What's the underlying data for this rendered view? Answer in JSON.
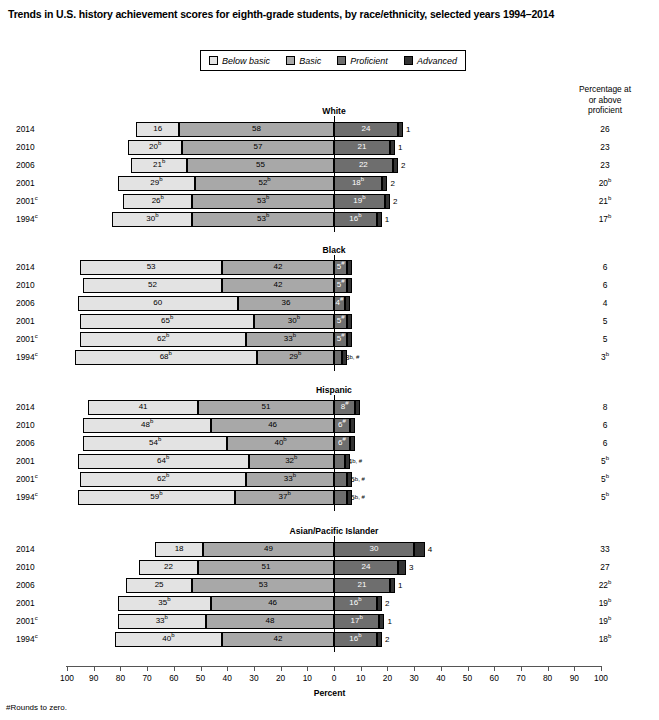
{
  "title": "Trends in U.S. history achievement scores for eighth-grade students, by race/ethnicity, selected years 1994–2014",
  "legend": {
    "items": [
      {
        "label": "Below basic",
        "color": "#e3e3e3",
        "key": "below"
      },
      {
        "label": "Basic",
        "color": "#a8a8a8",
        "key": "basic"
      },
      {
        "label": "Proficient",
        "color": "#6e6e6e",
        "key": "prof"
      },
      {
        "label": "Advanced",
        "color": "#333333",
        "key": "adv"
      }
    ]
  },
  "right_header": "Percentage at\nor above\nproficient",
  "right_header_lines": [
    "Percentage at",
    "or above",
    "proficient"
  ],
  "axis": {
    "label": "Percent",
    "ticks": [
      100,
      90,
      80,
      70,
      60,
      50,
      40,
      30,
      20,
      10,
      0,
      10,
      20,
      30,
      40,
      50,
      60,
      70,
      80,
      90,
      100
    ],
    "zero_index": 10,
    "left_max": 100,
    "right_max": 100
  },
  "footnote": "#Rounds to zero.",
  "chart_data": {
    "type": "bar",
    "title": "Trends in U.S. history achievement scores for eighth-grade students, by race/ethnicity, selected years 1994–2014",
    "subtype": "diverging-stacked-bar",
    "xlabel": "Percent",
    "ylabel": "",
    "xlim": [
      -100,
      100
    ],
    "grid": false,
    "legend_position": "top-center",
    "categories": [
      "Below basic",
      "Basic",
      "Proficient",
      "Advanced"
    ],
    "note": "Bars are centered so that the boundary between Basic and Proficient sits at the 0 axis position; percentages left of zero are Below basic + Basic, right of zero are Proficient + Advanced.",
    "groups": [
      {
        "name": "White",
        "rows": [
          {
            "year": "2014",
            "year_sup": "",
            "below": 16,
            "below_sup": "",
            "basic": 58,
            "basic_sup": "",
            "prof": 24,
            "prof_sup": "",
            "adv": 1,
            "adv_sup": "",
            "at_or_above": "26",
            "at_or_above_sup": ""
          },
          {
            "year": "2010",
            "year_sup": "",
            "below": 20,
            "below_sup": "b",
            "basic": 57,
            "basic_sup": "",
            "prof": 21,
            "prof_sup": "",
            "adv": 1,
            "adv_sup": "",
            "at_or_above": "23",
            "at_or_above_sup": ""
          },
          {
            "year": "2006",
            "year_sup": "",
            "below": 21,
            "below_sup": "b",
            "basic": 55,
            "basic_sup": "",
            "prof": 22,
            "prof_sup": "",
            "adv": 2,
            "adv_sup": "",
            "at_or_above": "23",
            "at_or_above_sup": ""
          },
          {
            "year": "2001",
            "year_sup": "",
            "below": 29,
            "below_sup": "b",
            "basic": 52,
            "basic_sup": "b",
            "prof": 18,
            "prof_sup": "b",
            "adv": 2,
            "adv_sup": "",
            "at_or_above": "20",
            "at_or_above_sup": "b"
          },
          {
            "year": "2001",
            "year_sup": "c",
            "below": 26,
            "below_sup": "b",
            "basic": 53,
            "basic_sup": "b",
            "prof": 19,
            "prof_sup": "b",
            "adv": 2,
            "adv_sup": "",
            "at_or_above": "21",
            "at_or_above_sup": "b"
          },
          {
            "year": "1994",
            "year_sup": "c",
            "below": 30,
            "below_sup": "b",
            "basic": 53,
            "basic_sup": "b",
            "prof": 16,
            "prof_sup": "b",
            "adv": 1,
            "adv_sup": "",
            "at_or_above": "17",
            "at_or_above_sup": "b"
          }
        ]
      },
      {
        "name": "Black",
        "rows": [
          {
            "year": "2014",
            "year_sup": "",
            "below": 53,
            "below_sup": "",
            "basic": 42,
            "basic_sup": "",
            "prof": 5,
            "prof_sup": "#",
            "adv": 0,
            "adv_sup": "",
            "at_or_above": "6",
            "at_or_above_sup": ""
          },
          {
            "year": "2010",
            "year_sup": "",
            "below": 52,
            "below_sup": "",
            "basic": 42,
            "basic_sup": "",
            "prof": 5,
            "prof_sup": "#",
            "adv": 0,
            "adv_sup": "",
            "at_or_above": "6",
            "at_or_above_sup": ""
          },
          {
            "year": "2006",
            "year_sup": "",
            "below": 60,
            "below_sup": "",
            "basic": 36,
            "basic_sup": "",
            "prof": 4,
            "prof_sup": "#",
            "adv": 0,
            "adv_sup": "",
            "at_or_above": "4",
            "at_or_above_sup": ""
          },
          {
            "year": "2001",
            "year_sup": "",
            "below": 65,
            "below_sup": "b",
            "basic": 30,
            "basic_sup": "b",
            "prof": 5,
            "prof_sup": "#",
            "adv": 0,
            "adv_sup": "",
            "at_or_above": "5",
            "at_or_above_sup": ""
          },
          {
            "year": "2001",
            "year_sup": "c",
            "below": 62,
            "below_sup": "b",
            "basic": 33,
            "basic_sup": "b",
            "prof": 5,
            "prof_sup": "#",
            "adv": 0,
            "adv_sup": "",
            "at_or_above": "5",
            "at_or_above_sup": ""
          },
          {
            "year": "1994",
            "year_sup": "c",
            "below": 68,
            "below_sup": "b",
            "basic": 29,
            "basic_sup": "b",
            "prof": 3,
            "prof_sup": "b, #",
            "prof_outside": true,
            "adv": 0,
            "adv_sup": "",
            "at_or_above": "3",
            "at_or_above_sup": "b"
          }
        ]
      },
      {
        "name": "Hispanic",
        "rows": [
          {
            "year": "2014",
            "year_sup": "",
            "below": 41,
            "below_sup": "",
            "basic": 51,
            "basic_sup": "",
            "prof": 8,
            "prof_sup": "#",
            "adv": 0,
            "adv_sup": "",
            "at_or_above": "8",
            "at_or_above_sup": ""
          },
          {
            "year": "2010",
            "year_sup": "",
            "below": 48,
            "below_sup": "b",
            "basic": 46,
            "basic_sup": "",
            "prof": 6,
            "prof_sup": "#",
            "adv": 0,
            "adv_sup": "",
            "at_or_above": "6",
            "at_or_above_sup": ""
          },
          {
            "year": "2006",
            "year_sup": "",
            "below": 54,
            "below_sup": "b",
            "basic": 40,
            "basic_sup": "b",
            "prof": 6,
            "prof_sup": "#",
            "adv": 0,
            "adv_sup": "",
            "at_or_above": "6",
            "at_or_above_sup": ""
          },
          {
            "year": "2001",
            "year_sup": "",
            "below": 64,
            "below_sup": "b",
            "basic": 32,
            "basic_sup": "b",
            "prof": 4,
            "prof_sup": "b, #",
            "prof_outside": true,
            "adv": 0,
            "adv_sup": "",
            "at_or_above": "5",
            "at_or_above_sup": "b"
          },
          {
            "year": "2001",
            "year_sup": "c",
            "below": 62,
            "below_sup": "b",
            "basic": 33,
            "basic_sup": "b",
            "prof": 5,
            "prof_sup": "b, #",
            "prof_outside": true,
            "adv": 0,
            "adv_sup": "",
            "at_or_above": "5",
            "at_or_above_sup": "b"
          },
          {
            "year": "1994",
            "year_sup": "c",
            "below": 59,
            "below_sup": "b",
            "basic": 37,
            "basic_sup": "b",
            "prof": 5,
            "prof_sup": "b, #",
            "prof_outside": true,
            "adv": 0,
            "adv_sup": "",
            "at_or_above": "5",
            "at_or_above_sup": "b"
          }
        ]
      },
      {
        "name": "Asian/Pacific Islander",
        "rows": [
          {
            "year": "2014",
            "year_sup": "",
            "below": 18,
            "below_sup": "",
            "basic": 49,
            "basic_sup": "",
            "prof": 30,
            "prof_sup": "",
            "adv": 4,
            "adv_sup": "",
            "at_or_above": "33",
            "at_or_above_sup": ""
          },
          {
            "year": "2010",
            "year_sup": "",
            "below": 22,
            "below_sup": "",
            "basic": 51,
            "basic_sup": "",
            "prof": 24,
            "prof_sup": "",
            "adv": 3,
            "adv_sup": "",
            "at_or_above": "27",
            "at_or_above_sup": ""
          },
          {
            "year": "2006",
            "year_sup": "",
            "below": 25,
            "below_sup": "",
            "basic": 53,
            "basic_sup": "",
            "prof": 21,
            "prof_sup": "",
            "adv": 1,
            "adv_sup": "",
            "at_or_above": "22",
            "at_or_above_sup": "b"
          },
          {
            "year": "2001",
            "year_sup": "",
            "below": 35,
            "below_sup": "b",
            "basic": 46,
            "basic_sup": "",
            "prof": 16,
            "prof_sup": "b",
            "adv": 2,
            "adv_sup": "",
            "at_or_above": "19",
            "at_or_above_sup": "b"
          },
          {
            "year": "2001",
            "year_sup": "c",
            "below": 33,
            "below_sup": "b",
            "basic": 48,
            "basic_sup": "",
            "prof": 17,
            "prof_sup": "b",
            "adv": 1,
            "adv_sup": "",
            "at_or_above": "19",
            "at_or_above_sup": "b"
          },
          {
            "year": "1994",
            "year_sup": "c",
            "below": 40,
            "below_sup": "b",
            "basic": 42,
            "basic_sup": "",
            "prof": 16,
            "prof_sup": "b",
            "adv": 2,
            "adv_sup": "",
            "at_or_above": "18",
            "at_or_above_sup": "b"
          }
        ]
      }
    ]
  }
}
